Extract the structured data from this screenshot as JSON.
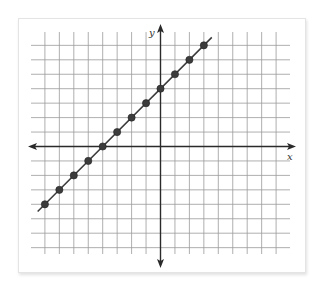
{
  "chart_data": {
    "type": "scatter",
    "title": "",
    "xlabel": "x",
    "ylabel": "y",
    "grid": true,
    "xlim": [
      -8,
      8
    ],
    "ylim": [
      -7,
      7
    ],
    "line": {
      "slope": 1,
      "intercept": 4,
      "equation": "y = x + 4"
    },
    "x": [
      -8,
      -7,
      -6,
      -5,
      -4,
      -3,
      -2,
      -1,
      0,
      1,
      2,
      3
    ],
    "y": [
      -4,
      -3,
      -2,
      -1,
      0,
      1,
      2,
      3,
      4,
      5,
      6,
      7
    ],
    "series": [
      {
        "name": "points",
        "values": [
          -4,
          -3,
          -2,
          -1,
          0,
          1,
          2,
          3,
          4,
          5,
          6,
          7
        ]
      }
    ]
  },
  "axes": {
    "x_label": "x",
    "y_label": "y"
  },
  "colors": {
    "grid": "#9a9a9a",
    "axis": "#2a2a2a",
    "line": "#3a3a3a",
    "point": "#3c3c3c"
  }
}
